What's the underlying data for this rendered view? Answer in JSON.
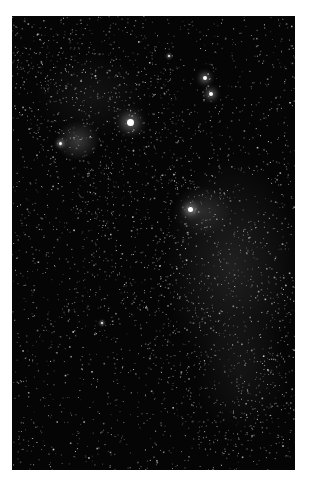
{
  "image": {
    "subject": "night sky star field with Milky Way",
    "alt": "Star field photograph showing the Milky Way band with bright stars and faint nebulosity",
    "background_color": "#050505",
    "frame_color": "#ffffff"
  },
  "bright_stars": [
    {
      "x": 118,
      "y": 106,
      "size": 7
    },
    {
      "x": 193,
      "y": 62,
      "size": 4
    },
    {
      "x": 199,
      "y": 78,
      "size": 4
    },
    {
      "x": 178,
      "y": 193,
      "size": 5
    },
    {
      "x": 48,
      "y": 127,
      "size": 3
    },
    {
      "x": 90,
      "y": 307,
      "size": 2
    },
    {
      "x": 157,
      "y": 40,
      "size": 2
    }
  ],
  "nebula_regions": [
    {
      "x": 65,
      "y": 125,
      "w": 45,
      "h": 40,
      "opacity": 0.28
    },
    {
      "x": 220,
      "y": 250,
      "w": 140,
      "h": 230,
      "opacity": 0.14
    },
    {
      "x": 190,
      "y": 195,
      "w": 60,
      "h": 50,
      "opacity": 0.16
    },
    {
      "x": 80,
      "y": 80,
      "w": 120,
      "h": 90,
      "opacity": 0.08
    },
    {
      "x": 230,
      "y": 360,
      "w": 100,
      "h": 120,
      "opacity": 0.08
    }
  ]
}
